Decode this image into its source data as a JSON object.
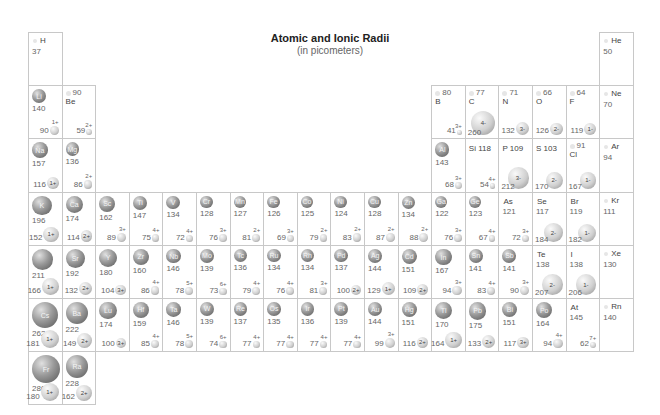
{
  "header": {
    "title": "Atomic and Ionic Radii",
    "subtitle": "(in picometers)"
  },
  "elements": [
    {
      "sym": "H",
      "period": 1,
      "group": 1,
      "atomic": 37
    },
    {
      "sym": "He",
      "period": 1,
      "group": 18,
      "atomic": 50
    },
    {
      "sym": "Li",
      "period": 2,
      "group": 1,
      "atomic": 140,
      "ionic": 90,
      "charge": "1+"
    },
    {
      "sym": "Be",
      "period": 2,
      "group": 2,
      "atomic": 90,
      "ionic": 59,
      "charge": "2+"
    },
    {
      "sym": "B",
      "period": 2,
      "group": 13,
      "atomic": 80,
      "ionic": 41,
      "charge": "3+"
    },
    {
      "sym": "C",
      "period": 2,
      "group": 14,
      "atomic": 77,
      "ionic": 260,
      "charge": "4-"
    },
    {
      "sym": "N",
      "period": 2,
      "group": 15,
      "atomic": 71,
      "ionic": 132,
      "charge": "3-"
    },
    {
      "sym": "O",
      "period": 2,
      "group": 16,
      "atomic": 66,
      "ionic": 126,
      "charge": "2-"
    },
    {
      "sym": "F",
      "period": 2,
      "group": 17,
      "atomic": 64,
      "ionic": 119,
      "charge": "1-"
    },
    {
      "sym": "Ne",
      "period": 2,
      "group": 18,
      "atomic": 70
    },
    {
      "sym": "Na",
      "period": 3,
      "group": 1,
      "atomic": 157,
      "ionic": 116,
      "charge": "1+"
    },
    {
      "sym": "Mg",
      "period": 3,
      "group": 2,
      "atomic": 136,
      "ionic": 86,
      "charge": "2+"
    },
    {
      "sym": "Al",
      "period": 3,
      "group": 13,
      "atomic": 143,
      "ionic": 68,
      "charge": "3+"
    },
    {
      "sym": "Si",
      "period": 3,
      "group": 14,
      "atomic": 118,
      "ionic": 54,
      "charge": "4+"
    },
    {
      "sym": "P",
      "period": 3,
      "group": 15,
      "atomic": 109,
      "ionic": 212,
      "charge": "3-"
    },
    {
      "sym": "S",
      "period": 3,
      "group": 16,
      "atomic": 103,
      "ionic": 170,
      "charge": "2-"
    },
    {
      "sym": "Cl",
      "period": 3,
      "group": 17,
      "atomic": 91,
      "ionic": 167,
      "charge": "1-"
    },
    {
      "sym": "Ar",
      "period": 3,
      "group": 18,
      "atomic": 94
    },
    {
      "sym": "K",
      "period": 4,
      "group": 1,
      "atomic": 196,
      "ionic": 152,
      "charge": "1+"
    },
    {
      "sym": "Ca",
      "period": 4,
      "group": 2,
      "atomic": 174,
      "ionic": 114,
      "charge": "2+"
    },
    {
      "sym": "Sc",
      "period": 4,
      "group": 3,
      "atomic": 162,
      "ionic": 89,
      "charge": "3+"
    },
    {
      "sym": "Ti",
      "period": 4,
      "group": 4,
      "atomic": 147,
      "ionic": 75,
      "charge": "4+"
    },
    {
      "sym": "V",
      "period": 4,
      "group": 5,
      "atomic": 134,
      "ionic": 72,
      "charge": "4+"
    },
    {
      "sym": "Cr",
      "period": 4,
      "group": 6,
      "atomic": 128,
      "ionic": 76,
      "charge": "3+"
    },
    {
      "sym": "Mn",
      "period": 4,
      "group": 7,
      "atomic": 127,
      "ionic": 81,
      "charge": "2+"
    },
    {
      "sym": "Fe",
      "period": 4,
      "group": 8,
      "atomic": 126,
      "ionic": 69,
      "charge": "3+"
    },
    {
      "sym": "Co",
      "period": 4,
      "group": 9,
      "atomic": 125,
      "ionic": 79,
      "charge": "2+"
    },
    {
      "sym": "Ni",
      "period": 4,
      "group": 10,
      "atomic": 124,
      "ionic": 83,
      "charge": "2+"
    },
    {
      "sym": "Cu",
      "period": 4,
      "group": 11,
      "atomic": 128,
      "ionic": 87,
      "charge": "2+"
    },
    {
      "sym": "Zn",
      "period": 4,
      "group": 12,
      "atomic": 134,
      "ionic": 88,
      "charge": "2+"
    },
    {
      "sym": "Ga",
      "period": 4,
      "group": 13,
      "atomic": 122,
      "ionic": 76,
      "charge": "3+"
    },
    {
      "sym": "Ge",
      "period": 4,
      "group": 14,
      "atomic": 123,
      "ionic": 67,
      "charge": "4+"
    },
    {
      "sym": "As",
      "period": 4,
      "group": 15,
      "atomic": 121,
      "ionic": 72,
      "charge": "3+"
    },
    {
      "sym": "Se",
      "period": 4,
      "group": 16,
      "atomic": 117,
      "ionic": 184,
      "charge": "2-"
    },
    {
      "sym": "Br",
      "period": 4,
      "group": 17,
      "atomic": 119,
      "ionic": 182,
      "charge": "1-"
    },
    {
      "sym": "Kr",
      "period": 4,
      "group": 18,
      "atomic": 111
    },
    {
      "sym": "Rb",
      "period": 5,
      "group": 1,
      "atomic": 211,
      "ionic": 166,
      "charge": "1+",
      "hideSym": true
    },
    {
      "sym": "Sr",
      "period": 5,
      "group": 2,
      "atomic": 192,
      "ionic": 132,
      "charge": "2+"
    },
    {
      "sym": "Y",
      "period": 5,
      "group": 3,
      "atomic": 180,
      "ionic": 104,
      "charge": "3+"
    },
    {
      "sym": "Zr",
      "period": 5,
      "group": 4,
      "atomic": 160,
      "ionic": 86,
      "charge": "4+"
    },
    {
      "sym": "Nb",
      "period": 5,
      "group": 5,
      "atomic": 146,
      "ionic": 78,
      "charge": "5+"
    },
    {
      "sym": "Mo",
      "period": 5,
      "group": 6,
      "atomic": 139,
      "ionic": 73,
      "charge": "6+"
    },
    {
      "sym": "Tc",
      "period": 5,
      "group": 7,
      "atomic": 136,
      "ionic": 79,
      "charge": "4+"
    },
    {
      "sym": "Ru",
      "period": 5,
      "group": 8,
      "atomic": 134,
      "ionic": 76,
      "charge": "4+"
    },
    {
      "sym": "Rh",
      "period": 5,
      "group": 9,
      "atomic": 134,
      "ionic": 81,
      "charge": "3+"
    },
    {
      "sym": "Pd",
      "period": 5,
      "group": 10,
      "atomic": 137,
      "ionic": 100,
      "charge": "2+"
    },
    {
      "sym": "Ag",
      "period": 5,
      "group": 11,
      "atomic": 144,
      "ionic": 129,
      "charge": "1+"
    },
    {
      "sym": "Cd",
      "period": 5,
      "group": 12,
      "atomic": 151,
      "ionic": 109,
      "charge": "2+"
    },
    {
      "sym": "In",
      "period": 5,
      "group": 13,
      "atomic": 167,
      "ionic": 94,
      "charge": "3+"
    },
    {
      "sym": "Sn",
      "period": 5,
      "group": 14,
      "atomic": 141,
      "ionic": 83,
      "charge": "4+"
    },
    {
      "sym": "Sb",
      "period": 5,
      "group": 15,
      "atomic": 141,
      "ionic": 90,
      "charge": "3+"
    },
    {
      "sym": "Te",
      "period": 5,
      "group": 16,
      "atomic": 138,
      "ionic": 207,
      "charge": "2-"
    },
    {
      "sym": "I",
      "period": 5,
      "group": 17,
      "atomic": 138,
      "ionic": 206,
      "charge": "1-"
    },
    {
      "sym": "Xe",
      "period": 5,
      "group": 18,
      "atomic": 130
    },
    {
      "sym": "Cs",
      "period": 6,
      "group": 1,
      "atomic": 262,
      "ionic": 181,
      "charge": "1+"
    },
    {
      "sym": "Ba",
      "period": 6,
      "group": 2,
      "atomic": 222,
      "ionic": 149,
      "charge": "2+"
    },
    {
      "sym": "Lu",
      "period": 6,
      "group": 3,
      "atomic": 174,
      "ionic": 100,
      "charge": "3+"
    },
    {
      "sym": "Hf",
      "period": 6,
      "group": 4,
      "atomic": 159,
      "ionic": 85,
      "charge": "4+"
    },
    {
      "sym": "Ta",
      "period": 6,
      "group": 5,
      "atomic": 146,
      "ionic": 78,
      "charge": "5+"
    },
    {
      "sym": "W",
      "period": 6,
      "group": 6,
      "atomic": 139,
      "ionic": 74,
      "charge": "6+"
    },
    {
      "sym": "Re",
      "period": 6,
      "group": 7,
      "atomic": 137,
      "ionic": 77,
      "charge": "4+"
    },
    {
      "sym": "Os",
      "period": 6,
      "group": 8,
      "atomic": 135,
      "ionic": 77,
      "charge": "4+"
    },
    {
      "sym": "Ir",
      "period": 6,
      "group": 9,
      "atomic": 136,
      "ionic": 77,
      "charge": "4+"
    },
    {
      "sym": "Pt",
      "period": 6,
      "group": 10,
      "atomic": 139,
      "ionic": 77,
      "charge": "4+"
    },
    {
      "sym": "Au",
      "period": 6,
      "group": 11,
      "atomic": 144,
      "ionic": 99,
      "charge": "3+"
    },
    {
      "sym": "Hg",
      "period": 6,
      "group": 12,
      "atomic": 151,
      "ionic": 116,
      "charge": "2+"
    },
    {
      "sym": "Tl",
      "period": 6,
      "group": 13,
      "atomic": 170,
      "ionic": 164,
      "charge": "1+"
    },
    {
      "sym": "Pb",
      "period": 6,
      "group": 14,
      "atomic": 175,
      "ionic": 133,
      "charge": "2+"
    },
    {
      "sym": "Bi",
      "period": 6,
      "group": 15,
      "atomic": 151,
      "ionic": 117,
      "charge": "3+"
    },
    {
      "sym": "Po",
      "period": 6,
      "group": 16,
      "atomic": 164,
      "ionic": 94,
      "charge": "4+"
    },
    {
      "sym": "At",
      "period": 6,
      "group": 17,
      "atomic": 145,
      "ionic": 62,
      "charge": "7+"
    },
    {
      "sym": "Rn",
      "period": 6,
      "group": 18,
      "atomic": 140
    },
    {
      "sym": "Fr",
      "period": 7,
      "group": 1,
      "atomic": 280,
      "ionic": 180,
      "charge": "1+"
    },
    {
      "sym": "Ra",
      "period": 7,
      "group": 2,
      "atomic": 228,
      "ionic": 162,
      "charge": "2+"
    }
  ],
  "layout": {
    "grid_left": 28,
    "grid_top": 32,
    "col_width": 33.6,
    "row_height": 53.2
  }
}
